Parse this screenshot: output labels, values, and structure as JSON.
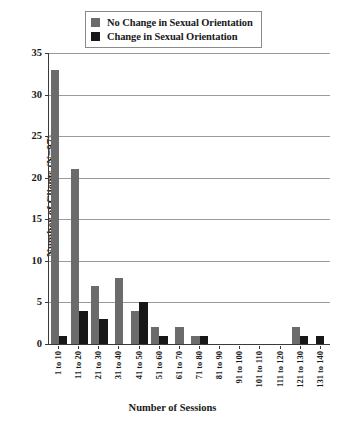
{
  "chart_data": {
    "type": "bar",
    "title": "",
    "xlabel": "Number of Sessions",
    "ylabel": "Number of Clients (N=97)",
    "ylim": [
      0,
      35
    ],
    "yticks": [
      0,
      5,
      10,
      15,
      20,
      25,
      30,
      35
    ],
    "grid": true,
    "legend_position": "top",
    "categories": [
      "1 to 10",
      "11 to 20",
      "21 to 30",
      "31 to 40",
      "41 to 50",
      "51 to 60",
      "61 to 70",
      "71 to 80",
      "81 to 90",
      "91 to 100",
      "101 to 110",
      "111 to 120",
      "121 to 130",
      "131 to 140"
    ],
    "series": [
      {
        "name": "No Change in Sexual Orientation",
        "color": "#6b6b6b",
        "values": [
          33,
          21,
          7,
          8,
          4,
          2,
          2,
          1,
          0,
          0,
          0,
          0,
          2,
          0
        ]
      },
      {
        "name": "Change in Sexual Orientation",
        "color": "#171717",
        "values": [
          1,
          4,
          3,
          0,
          5,
          1,
          0,
          1,
          0,
          0,
          0,
          0,
          1,
          1
        ]
      }
    ]
  },
  "legend": {
    "items": [
      {
        "label": "No Change in Sexual Orientation",
        "color": "#6b6b6b"
      },
      {
        "label": "Change in Sexual Orientation",
        "color": "#171717"
      }
    ]
  },
  "axes": {
    "y_title": "Number of Clients (N=97)",
    "x_title": "Number of Sessions",
    "y_ticks": [
      "0",
      "5",
      "10",
      "15",
      "20",
      "25",
      "30",
      "35"
    ]
  }
}
